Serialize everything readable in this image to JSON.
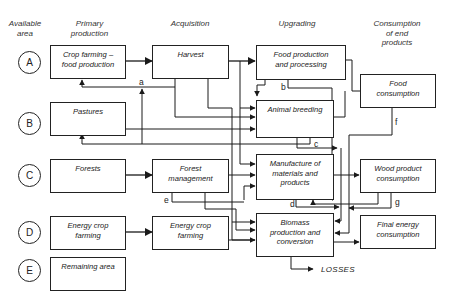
{
  "headers": {
    "available_area": "Available\narea",
    "primary_production": "Primary\nproduction",
    "acquisition": "Acquisition",
    "upgrading": "Upgrading",
    "consumption": "Consumption\nof end\nproducts"
  },
  "areas": [
    {
      "id": "A",
      "label": "A"
    },
    {
      "id": "B",
      "label": "B"
    },
    {
      "id": "C",
      "label": "C"
    },
    {
      "id": "D",
      "label": "D"
    },
    {
      "id": "E",
      "label": "E"
    }
  ],
  "primary_production": [
    {
      "label": "Crop farming –\nfood production"
    },
    {
      "label": "Pastures"
    },
    {
      "label": "Forests"
    },
    {
      "label": "Energy crop\nfarming"
    },
    {
      "label": "Remaining area"
    }
  ],
  "acquisition": [
    {
      "label": "Harvest"
    },
    {
      "label": "Forest\nmanagement"
    },
    {
      "label": "Energy crop\nfarming"
    }
  ],
  "upgrading": [
    {
      "label": "Food production\nand processing"
    },
    {
      "label": "Animal breeding"
    },
    {
      "label": "Manufacture of\nmaterials and\nproducts"
    },
    {
      "label": "Biomass\nproduction and\nconversion"
    }
  ],
  "consumption": [
    {
      "label": "Food\nconsumption"
    },
    {
      "label": "Wood product\nconsumption"
    },
    {
      "label": "Final energy\nconsumption"
    }
  ],
  "flow_labels": {
    "a": "a",
    "b": "b",
    "c": "c",
    "d": "d",
    "e": "e",
    "f": "f",
    "g": "g"
  },
  "losses": "LOSSES",
  "colors": {
    "line": "#1a1a1a",
    "text": "#222222",
    "background": "#ffffff"
  }
}
